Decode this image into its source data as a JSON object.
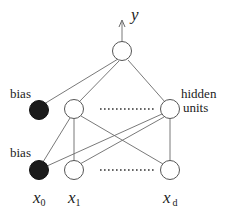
{
  "diagram": {
    "type": "neural-network",
    "output": {
      "label": "y"
    },
    "hidden_layer": {
      "label_line1": "hidden",
      "label_line2": "units",
      "bias_label": "bias"
    },
    "input_layer": {
      "bias_label": "bias",
      "inputs": [
        {
          "base": "x",
          "sub": "0"
        },
        {
          "base": "x",
          "sub": "1"
        },
        {
          "base": "x",
          "sub": "d"
        }
      ]
    },
    "colors": {
      "bias_fill": "#1a1a1a",
      "node_fill": "#ffffff",
      "edge": "#6a6a6a"
    }
  }
}
